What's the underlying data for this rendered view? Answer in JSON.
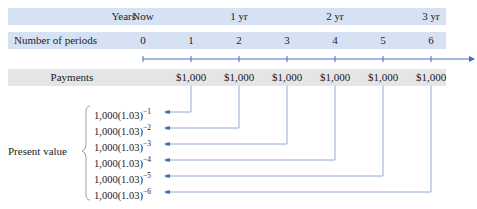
{
  "rows": {
    "years": {
      "label": "Years",
      "cells": [
        {
          "text": "Now",
          "x": 143
        },
        {
          "text": "1 yr",
          "x": 239
        },
        {
          "text": "2 yr",
          "x": 335
        },
        {
          "text": "3 yr",
          "x": 431
        }
      ]
    },
    "periods": {
      "label": "Number of periods",
      "cells": [
        "0",
        "1",
        "2",
        "3",
        "4",
        "5",
        "6"
      ]
    },
    "payments": {
      "label": "Payments",
      "cells": [
        "$1,000",
        "$1,000",
        "$1,000",
        "$1,000",
        "$1,000",
        "$1,000"
      ]
    }
  },
  "present_value": {
    "label": "Present value",
    "base": "1,000(1.03)",
    "exponents": [
      "−1",
      "−2",
      "−3",
      "−4",
      "−5",
      "−6"
    ]
  },
  "colors": {
    "blue_band": "#d6e2f3",
    "gray_band": "#e4e5e7",
    "line": "#4a6cc0",
    "connector": "#8fa5d8"
  }
}
